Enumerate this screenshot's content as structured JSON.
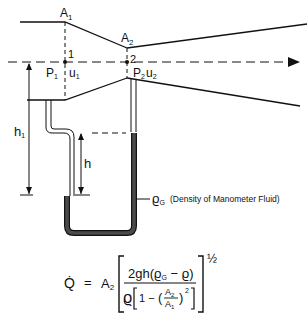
{
  "diagram": {
    "labels": {
      "A1": "A",
      "A1_sub": "1",
      "A2": "A",
      "A2_sub": "2",
      "station1": "1",
      "station2": "2",
      "p1": "P",
      "p1_sub": "1",
      "u1": "u",
      "u1_sub": "1",
      "p2": "P",
      "p2_sub": "2",
      "u2": "u",
      "u2_sub": "2",
      "h1": "h",
      "h1_sub": "1",
      "h": "h",
      "rhoG": "ϱ",
      "rhoG_sub": "G",
      "rhoG_desc": "(Density of Manometer Fluid)"
    },
    "formula": {
      "lhs": "Q̇",
      "equals": "=",
      "coef": "A",
      "coef_sub": "2",
      "numerator": "2gh(ϱ",
      "numerator_sub": "G",
      "numerator_end": " − ϱ)",
      "denominator_rho": "ϱ",
      "denominator_one": "1 −",
      "frac_num": "A",
      "frac_num_sub": "2",
      "frac_den": "A",
      "frac_den_sub": "1",
      "square": "2",
      "exponent": "½"
    },
    "colors": {
      "line": "#111111",
      "manometer_fluid": "#4a4a4a"
    }
  }
}
